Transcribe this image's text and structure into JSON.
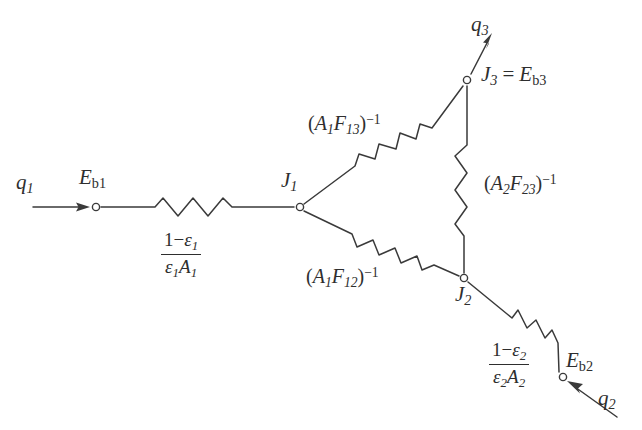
{
  "diagram": {
    "type": "resistance-network",
    "background_color": "#ffffff",
    "stroke_color": "#3a3a3a",
    "text_color": "#2e2e2e"
  },
  "nodes": [
    {
      "id": "Eb1",
      "label_main": "E",
      "label_sub": "b1",
      "x": 96,
      "y": 207
    },
    {
      "id": "J1",
      "label_main": "J",
      "label_sub": "1",
      "x": 300,
      "y": 207
    },
    {
      "id": "J3",
      "label_main": "J",
      "label_sub": "3",
      "x": 467,
      "y": 80
    },
    {
      "id": "J2",
      "label_main": "J",
      "label_sub": "2",
      "x": 464,
      "y": 278
    },
    {
      "id": "Eb2",
      "label_main": "E",
      "label_sub": "b2",
      "x": 563,
      "y": 377
    }
  ],
  "labels": {
    "q1": {
      "main": "q",
      "sub": "1"
    },
    "q2": {
      "main": "q",
      "sub": "2"
    },
    "q3": {
      "main": "q",
      "sub": "3"
    },
    "Eb1": {
      "main": "E",
      "sub": "b1"
    },
    "Eb2": {
      "main": "E",
      "sub": "b2"
    },
    "J1": {
      "main": "J",
      "sub": "1"
    },
    "J2": {
      "main": "J",
      "sub": "2"
    },
    "J3_equality": {
      "left_main": "J",
      "left_sub": "3",
      "equals": "=",
      "right_main": "E",
      "right_sub": "b3"
    }
  },
  "resistors": [
    {
      "id": "surface-1",
      "between": [
        "Eb1",
        "J1"
      ],
      "numerator": "1−ε₁",
      "denominator": "ε₁A₁",
      "form": "fraction",
      "num_parts": {
        "one": "1−",
        "eps": "ε",
        "eps_sub": "1"
      },
      "den_parts": {
        "eps": "ε",
        "eps_sub": "1",
        "A": "A",
        "A_sub": "1"
      }
    },
    {
      "id": "space-13",
      "between": [
        "J1",
        "J3"
      ],
      "text": "(A₁F₁₃)⁻¹",
      "parts": {
        "open": "(",
        "A": "A",
        "A_sub": "1",
        "F": "F",
        "F_sub": "13",
        "close": ")",
        "exp": "−1"
      }
    },
    {
      "id": "space-23",
      "between": [
        "J2",
        "J3"
      ],
      "text": "(A₂F₂₃)⁻¹",
      "parts": {
        "open": "(",
        "A": "A",
        "A_sub": "2",
        "F": "F",
        "F_sub": "23",
        "close": ")",
        "exp": "−1"
      }
    },
    {
      "id": "space-12",
      "between": [
        "J1",
        "J2"
      ],
      "text": "(A₁F₁₂)⁻¹",
      "parts": {
        "open": "(",
        "A": "A",
        "A_sub": "1",
        "F": "F",
        "F_sub": "12",
        "close": ")",
        "exp": "−1"
      }
    },
    {
      "id": "surface-2",
      "between": [
        "J2",
        "Eb2"
      ],
      "numerator": "1−ε₂",
      "denominator": "ε₂A₂",
      "form": "fraction",
      "num_parts": {
        "one": "1−",
        "eps": "ε",
        "eps_sub": "2"
      },
      "den_parts": {
        "eps": "ε",
        "eps_sub": "2",
        "A": "A",
        "A_sub": "2"
      }
    }
  ],
  "arrows": [
    {
      "id": "q1-arrow",
      "direction": "right",
      "into_node": "Eb1",
      "label": "q1"
    },
    {
      "id": "q2-arrow",
      "direction": "up-left",
      "into_node": "Eb2",
      "label": "q2"
    },
    {
      "id": "q3-arrow",
      "direction": "up-right",
      "out_of_node": "J3",
      "label": "q3"
    }
  ]
}
